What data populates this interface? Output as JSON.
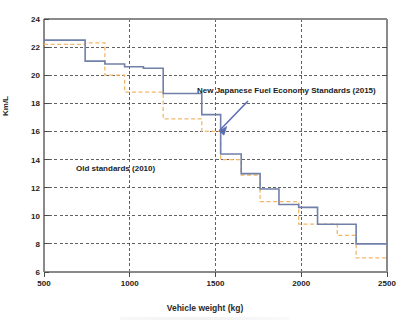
{
  "chart_data": {
    "type": "line",
    "title": "",
    "subtitle": "",
    "xlabel": "Vehicle weight (kg)",
    "ylabel": "Km/L",
    "xlim": [
      500,
      2500
    ],
    "ylim": [
      6,
      24
    ],
    "grid": true,
    "legend_position": "inline-annotations",
    "xticks": [
      "500",
      "1000",
      "1500",
      "2000",
      "2500"
    ],
    "xtick_values": [
      500,
      1000,
      1500,
      2000,
      2500
    ],
    "yticks": [
      "24",
      "22",
      "20",
      "18",
      "16",
      "14",
      "12",
      "10",
      "8",
      "6"
    ],
    "ytick_values": [
      24,
      22,
      20,
      18,
      16,
      14,
      12,
      10,
      8,
      6
    ],
    "annotations": [
      {
        "text": "New Japanese Fuel Economy Standards (2015)",
        "x": 1830,
        "y": 18.6
      },
      {
        "text": "Old standards (2010)",
        "x": 1030,
        "y": 13.4
      }
    ],
    "series": [
      {
        "name": "New Japanese Fuel Economy Standards (2015)",
        "style": "step-solid",
        "color": "#7080a8",
        "x_edges": [
          500,
          610,
          740,
          855,
          970,
          1080,
          1195,
          1310,
          1420,
          1530,
          1650,
          1760,
          1870,
          1985,
          2095,
          2210,
          2320,
          2500
        ],
        "values": [
          22.5,
          22.5,
          21.0,
          20.8,
          20.6,
          20.5,
          18.7,
          18.7,
          17.2,
          14.4,
          13.0,
          11.9,
          10.8,
          10.6,
          9.4,
          9.4,
          8.0,
          8.0
        ]
      },
      {
        "name": "Old standards (2010)",
        "style": "step-dashed",
        "color": "#f2b76a",
        "x_edges": [
          500,
          610,
          740,
          855,
          970,
          1080,
          1195,
          1310,
          1420,
          1530,
          1650,
          1760,
          1870,
          1985,
          2095,
          2210,
          2320,
          2500
        ],
        "values": [
          22.2,
          22.2,
          22.3,
          20.0,
          18.8,
          18.8,
          16.9,
          16.9,
          16.0,
          14.0,
          12.9,
          11.0,
          11.0,
          9.4,
          9.4,
          8.6,
          7.0,
          7.0
        ]
      }
    ]
  },
  "axis": {
    "y_title": "Km/L",
    "x_title": "Vehicle weight (kg)"
  },
  "labels": {
    "new_standards": "New Japanese Fuel Economy Standards (2015)",
    "old_standards": "Old standards (2010)"
  },
  "colors": {
    "new_series": "#7080a8",
    "old_series": "#f2b76a",
    "grid": "#333333",
    "axis": "#808080",
    "arrow": "#5b6bb0",
    "text": "#1c1c1c"
  }
}
